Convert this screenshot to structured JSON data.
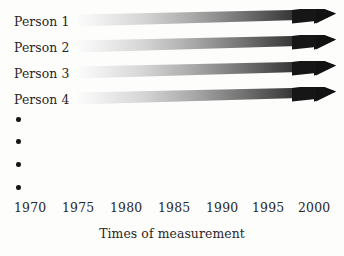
{
  "figure": {
    "width": 344,
    "height": 256,
    "background_color": "#fdfdfc",
    "ink_color": "#221f1e"
  },
  "chart_data": {
    "type": "diagram",
    "title": "",
    "xlabel": "Times of measurement",
    "ylabel": "",
    "xlim": [
      1970,
      2000
    ],
    "grid": false,
    "legend_position": "none",
    "x_tick_labels": [
      "1970",
      "1975",
      "1980",
      "1985",
      "1990",
      "1995",
      "2000"
    ],
    "x_tick_values": [
      1970,
      1975,
      1980,
      1985,
      1990,
      1995,
      2000
    ],
    "series": [
      {
        "name": "Person 1",
        "arrow_start_year": 1973,
        "arrow_end_year": 2000,
        "gradient_from": "#f2f2f2",
        "gradient_to": "#111111"
      },
      {
        "name": "Person 2",
        "arrow_start_year": 1973,
        "arrow_end_year": 2000,
        "gradient_from": "#f2f2f2",
        "gradient_to": "#111111"
      },
      {
        "name": "Person 3",
        "arrow_start_year": 1973,
        "arrow_end_year": 2000,
        "gradient_from": "#f2f2f2",
        "gradient_to": "#111111"
      },
      {
        "name": "Person 4",
        "arrow_start_year": 1973,
        "arrow_end_year": 2000,
        "gradient_from": "#f2f2f2",
        "gradient_to": "#111111"
      }
    ],
    "continuation_marker": {
      "symbol": "vertical-ellipsis",
      "dot_count": 4
    },
    "annotations": []
  },
  "rows": [
    {
      "label": "Person 1",
      "top": 9
    },
    {
      "label": "Person 2",
      "top": 35
    },
    {
      "label": "Person 3",
      "top": 61
    },
    {
      "label": "Person 4",
      "top": 87
    }
  ],
  "ellipsis": {
    "name": "vertical-ellipsis",
    "dots": [
      {
        "top": 117
      },
      {
        "top": 139
      },
      {
        "top": 162
      },
      {
        "top": 185
      }
    ]
  },
  "axis": {
    "ticks": [
      {
        "label": "1970",
        "left": 14
      },
      {
        "label": "1975",
        "left": 62
      },
      {
        "label": "1980",
        "left": 110
      },
      {
        "label": "1985",
        "left": 158
      },
      {
        "label": "1990",
        "left": 206
      },
      {
        "label": "1995",
        "left": 252
      },
      {
        "label": "2000",
        "left": 298
      }
    ]
  },
  "caption": {
    "text": "Times of measurement"
  }
}
